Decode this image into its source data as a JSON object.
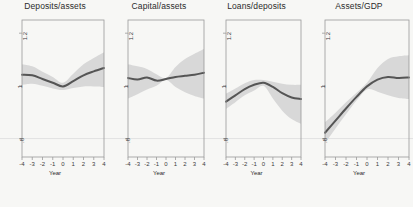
{
  "figure": {
    "width": 413,
    "height": 207,
    "background": "#f7f7f5",
    "line_color": "#555555",
    "band_color": "#d8d8d8",
    "axis_color": "#9a9a9a",
    "text_color": "#2b2b2b"
  },
  "axis": {
    "xlabel": "Year",
    "xticks": [
      "-4",
      "-3",
      "-2",
      "-1",
      "0",
      "1",
      "2",
      "3",
      "4"
    ],
    "xvalues": [
      -4,
      -3,
      -2,
      -1,
      0,
      1,
      2,
      3,
      4
    ],
    "yticks": [
      "1.2",
      "1",
      ".8"
    ],
    "yvalues": [
      1.2,
      1.0,
      0.8
    ],
    "ylim": [
      0.73,
      1.25
    ]
  },
  "chart_data": [
    {
      "type": "line",
      "title": "Deposits/assets",
      "xlabel": "Year",
      "ylabel": "",
      "x": [
        -4,
        -3,
        -2,
        -1,
        0,
        1,
        2,
        3,
        4
      ],
      "values": [
        1.042,
        1.04,
        1.026,
        1.012,
        0.998,
        1.018,
        1.04,
        1.055,
        1.068
      ],
      "band_lower": [
        1.004,
        1.008,
        1.0,
        0.99,
        0.984,
        0.992,
        0.998,
        0.998,
        0.996
      ],
      "band_upper": [
        1.082,
        1.074,
        1.054,
        1.034,
        1.012,
        1.046,
        1.082,
        1.106,
        1.128
      ],
      "ylim": [
        0.73,
        1.25
      ],
      "grid": false,
      "legend": "none"
    },
    {
      "type": "line",
      "title": "Capital/assets",
      "xlabel": "Year",
      "ylabel": "",
      "x": [
        -4,
        -3,
        -2,
        -1,
        0,
        1,
        2,
        3,
        4
      ],
      "values": [
        1.03,
        1.024,
        1.032,
        1.02,
        1.026,
        1.034,
        1.038,
        1.042,
        1.05
      ],
      "band_lower": [
        0.952,
        0.968,
        0.986,
        1.0,
        1.022,
        0.996,
        0.976,
        0.962,
        0.952
      ],
      "band_upper": [
        1.082,
        1.074,
        1.064,
        1.044,
        1.03,
        1.072,
        1.102,
        1.122,
        1.14
      ],
      "ylim": [
        0.73,
        1.25
      ],
      "grid": false,
      "legend": "none"
    },
    {
      "type": "line",
      "title": "Loans/deposits",
      "xlabel": "Year",
      "ylabel": "",
      "x": [
        -4,
        -3,
        -2,
        -1,
        0,
        1,
        2,
        3,
        4
      ],
      "values": [
        0.94,
        0.964,
        0.988,
        1.004,
        1.012,
        0.996,
        0.972,
        0.956,
        0.95
      ],
      "band_lower": [
        0.912,
        0.938,
        0.964,
        0.982,
        1.0,
        0.952,
        0.906,
        0.874,
        0.856
      ],
      "band_upper": [
        0.97,
        0.99,
        1.01,
        1.022,
        1.022,
        1.016,
        1.008,
        1.004,
        1.004
      ],
      "ylim": [
        0.73,
        1.25
      ],
      "grid": false,
      "legend": "none"
    },
    {
      "type": "line",
      "title": "Assets/GDP",
      "xlabel": "Year",
      "ylabel": "",
      "x": [
        -4,
        -3,
        -2,
        -1,
        0,
        1,
        2,
        3,
        4
      ],
      "values": [
        0.822,
        0.868,
        0.914,
        0.958,
        0.998,
        1.024,
        1.034,
        1.03,
        1.032
      ],
      "band_lower": [
        0.782,
        0.838,
        0.892,
        0.944,
        0.986,
        0.978,
        0.964,
        0.954,
        0.95
      ],
      "band_upper": [
        0.862,
        0.898,
        0.938,
        0.974,
        1.012,
        1.068,
        1.102,
        1.112,
        1.116
      ],
      "ylim": [
        0.73,
        1.25
      ],
      "grid": false,
      "legend": "none"
    }
  ]
}
